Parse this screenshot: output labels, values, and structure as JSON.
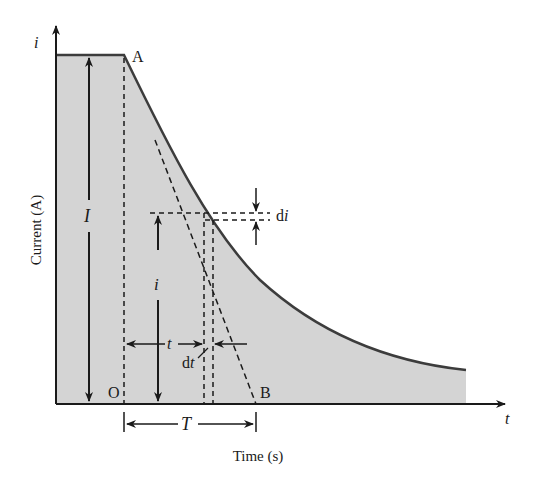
{
  "diagram": {
    "axes": {
      "y_axis_symbol": "i",
      "x_axis_symbol": "t",
      "y_label": "Current (A)",
      "x_label": "Time (s)"
    },
    "points": {
      "A": "A",
      "O": "O",
      "B": "B"
    },
    "annotations": {
      "initial_current": "I",
      "instant_current": "i",
      "elapsed_time": "t",
      "current_increment": "di",
      "time_increment": "dt",
      "time_constant": "T"
    },
    "colors": {
      "fill": "#d4d4d4",
      "curve": "#3c3c3c",
      "line": "#1a1a1a",
      "background": "#ffffff"
    }
  }
}
